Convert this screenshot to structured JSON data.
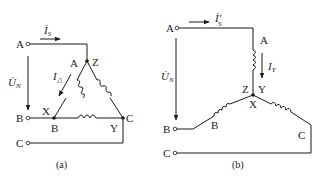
{
  "diagram_a": {
    "caption": "(a)",
    "terminals": [
      "A",
      "B",
      "C"
    ],
    "nodes": {
      "top": "Z",
      "left": "X",
      "right": "C"
    },
    "winding_labels": {
      "left_top": "A",
      "left_bottom": "B",
      "right_bottom": "Y"
    },
    "current_label": "İ",
    "current_sub": "S",
    "delta_current": "I",
    "delta_sub": "△",
    "voltage_label": "U̇",
    "voltage_sub": "N"
  },
  "diagram_b": {
    "caption": "(b)",
    "terminals": [
      "A",
      "B",
      "C"
    ],
    "center_labels": {
      "left": "Z",
      "right": "Y",
      "bottom": "X"
    },
    "winding_labels": {
      "top": "A",
      "left": "B",
      "right": "C"
    },
    "current_label": "İ",
    "current_sub": "S",
    "current_prime": "′",
    "star_current": "I",
    "star_sub": "Y",
    "voltage_label": "U̇",
    "voltage_sub": "N"
  }
}
